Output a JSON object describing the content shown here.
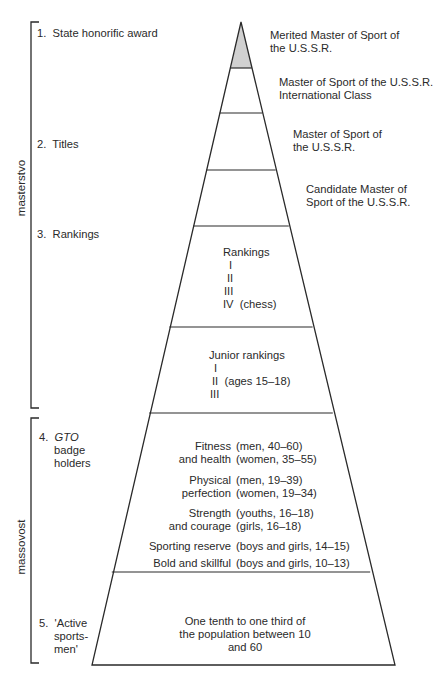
{
  "diagram": {
    "type": "pyramid",
    "shade_color": "#d0d0d0",
    "line_color": "#2a2a2a",
    "brackets": [
      {
        "label": "masterstvo"
      },
      {
        "label": "massovost"
      }
    ],
    "left_labels": [
      {
        "num": "1.",
        "text": "State honorific award"
      },
      {
        "num": "2.",
        "text": "Titles"
      },
      {
        "num": "3.",
        "text": "Rankings"
      },
      {
        "num": "4.",
        "em": "GTO",
        "line2": "badge",
        "line3": "holders"
      },
      {
        "num": "5.",
        "line1": "'Active",
        "line2": "sports-",
        "line3": "men'"
      }
    ],
    "tiers": [
      {
        "id": "merited-master",
        "line1": "Merited Master of Sport of",
        "line2": "the U.S.S.R.",
        "shaded": true
      },
      {
        "id": "master-international",
        "line1": "Master of Sport of the U.S.S.R.",
        "line2": "International Class"
      },
      {
        "id": "master",
        "line1": "Master of Sport of",
        "line2": "the U.S.S.R."
      },
      {
        "id": "candidate-master",
        "line1": "Candidate Master of",
        "line2": "Sport of the U.S.S.R."
      },
      {
        "id": "rankings",
        "title": "Rankings",
        "items": [
          "I",
          "II",
          "III",
          "IV  (chess)"
        ]
      },
      {
        "id": "junior-rankings",
        "title": "Junior rankings",
        "items": [
          "I",
          "II  (ages 15–18)",
          "III"
        ]
      },
      {
        "id": "gto",
        "rows": [
          {
            "label1": "Fitness",
            "label2": "and health",
            "age1": "(men, 40–60)",
            "age2": "(women, 35–55)"
          },
          {
            "label1": "Physical",
            "label2": "perfection",
            "age1": "(men, 19–39)",
            "age2": "(women, 19–34)"
          },
          {
            "label1": "Strength",
            "label2": "and courage",
            "age1": "(youths, 16–18)",
            "age2": "(girls, 16–18)"
          },
          {
            "label1": "Sporting reserve",
            "age1": "(boys and girls, 14–15)"
          },
          {
            "label1": "Bold and skillful",
            "age1": "(boys and girls, 10–13)"
          }
        ]
      },
      {
        "id": "active-sportsmen",
        "line1": "One tenth to one third of",
        "line2": "the population between 10",
        "line3": "and 60"
      }
    ]
  }
}
